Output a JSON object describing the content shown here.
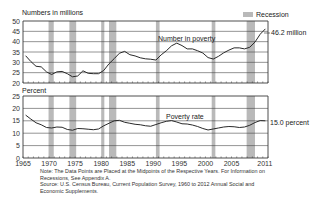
{
  "chart_data": [
    {
      "type": "line",
      "panel": "top",
      "title": "",
      "ylabel": "Numbers in millions",
      "xlabel": "",
      "ylim": [
        20,
        50
      ],
      "yticks": [
        20,
        25,
        30,
        35,
        40,
        45,
        50
      ],
      "xlim": [
        1965,
        2012
      ],
      "grid": true,
      "series": [
        {
          "name": "Number in poverty",
          "x": [
            1965,
            1966,
            1967,
            1968,
            1969,
            1970,
            1971,
            1972,
            1973,
            1974,
            1975,
            1976,
            1977,
            1978,
            1979,
            1980,
            1981,
            1982,
            1983,
            1984,
            1985,
            1986,
            1987,
            1988,
            1989,
            1990,
            1991,
            1992,
            1993,
            1994,
            1995,
            1996,
            1997,
            1998,
            1999,
            2000,
            2001,
            2002,
            2003,
            2004,
            2005,
            2006,
            2007,
            2008,
            2009,
            2010,
            2011
          ],
          "values": [
            33.2,
            30.4,
            28.1,
            27.8,
            25.4,
            24.1,
            25.4,
            25.6,
            24.5,
            23.0,
            23.4,
            25.9,
            24.7,
            24.5,
            24.5,
            26.1,
            29.3,
            31.8,
            34.4,
            35.3,
            33.7,
            33.1,
            32.2,
            31.7,
            31.5,
            31.1,
            33.6,
            35.6,
            38.0,
            39.3,
            38.1,
            36.5,
            36.5,
            35.6,
            34.5,
            32.3,
            31.6,
            32.9,
            34.6,
            35.9,
            37.0,
            37.0,
            36.5,
            37.3,
            39.8,
            43.6,
            46.2
          ]
        }
      ],
      "annotations": [
        {
          "text": "Number in poverty",
          "at": "mid-plot near 1993"
        },
        {
          "text": "46.2 million",
          "at": "right of 2011 endpoint"
        }
      ]
    },
    {
      "type": "line",
      "panel": "bottom",
      "title": "",
      "ylabel": "Percent",
      "xlabel": "",
      "ylim": [
        0,
        25
      ],
      "yticks": [
        0,
        5,
        10,
        15,
        20,
        25
      ],
      "xlim": [
        1965,
        2012
      ],
      "xticks": [
        1965,
        1970,
        1975,
        1980,
        1985,
        1990,
        1995,
        2000,
        2005,
        2011
      ],
      "grid": true,
      "series": [
        {
          "name": "Poverty rate",
          "x": [
            1965,
            1966,
            1967,
            1968,
            1969,
            1970,
            1971,
            1972,
            1973,
            1974,
            1975,
            1976,
            1977,
            1978,
            1979,
            1980,
            1981,
            1982,
            1983,
            1984,
            1985,
            1986,
            1987,
            1988,
            1989,
            1990,
            1991,
            1992,
            1993,
            1994,
            1995,
            1996,
            1997,
            1998,
            1999,
            2000,
            2001,
            2002,
            2003,
            2004,
            2005,
            2006,
            2007,
            2008,
            2009,
            2010,
            2011
          ],
          "values": [
            17.3,
            15.7,
            14.2,
            13.4,
            12.3,
            12.1,
            12.5,
            12.4,
            11.5,
            11.2,
            11.9,
            11.8,
            11.6,
            11.4,
            11.7,
            13.0,
            14.0,
            15.0,
            15.2,
            14.4,
            14.0,
            13.6,
            13.4,
            13.0,
            12.8,
            13.5,
            14.2,
            14.8,
            15.1,
            14.5,
            13.8,
            13.7,
            13.3,
            12.7,
            11.9,
            11.3,
            11.7,
            12.1,
            12.5,
            12.7,
            12.6,
            12.3,
            12.5,
            13.2,
            14.3,
            15.1,
            15.0
          ]
        }
      ],
      "annotations": [
        {
          "text": "Poverty rate",
          "at": "mid-plot near 1993"
        },
        {
          "text": "15.0 percent",
          "at": "right of 2011 endpoint"
        }
      ]
    }
  ],
  "recessions": [
    [
      1969.9,
      1970.9
    ],
    [
      1973.9,
      1975.2
    ],
    [
      1980.0,
      1980.6
    ],
    [
      1981.5,
      1982.9
    ],
    [
      1990.5,
      1991.2
    ],
    [
      2001.2,
      2001.9
    ],
    [
      2007.9,
      2009.5
    ]
  ],
  "legend": {
    "label": "Recession",
    "placement": "top-right",
    "color": "#b9b9b9"
  },
  "top_panel": {
    "ylabel": "Numbers in millions",
    "series_label": "Number in poverty",
    "end_label": "46.2 million"
  },
  "bottom_panel": {
    "ylabel": "Percent",
    "series_label": "Poverty rate",
    "end_label": "15.0 percent"
  },
  "notes": {
    "line1": "Note:  The Data Points are Placed at the Midpoints of the Respective Years. For Information on",
    "line2": "Recessions, See Appendix A.",
    "line3": "Source:  U.S. Census Bureau, Current Population Survey, 1960 to 2012 Annual Social and",
    "line4": "Economic Supplements."
  },
  "colors": {
    "line": "#2a2a2a",
    "grid": "#3a3a3a",
    "recession": "#b9b9b9"
  }
}
